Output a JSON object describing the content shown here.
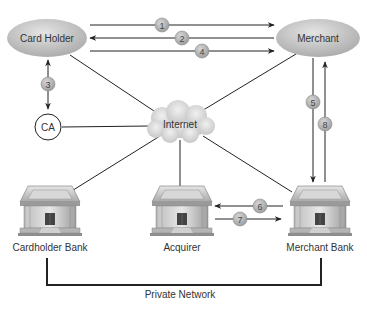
{
  "diagram": {
    "nodes": {
      "card_holder": {
        "label": "Card Holder"
      },
      "merchant": {
        "label": "Merchant"
      },
      "ca": {
        "label": "CA"
      },
      "internet": {
        "label": "Internet"
      },
      "cardholder_bank": {
        "label": "Cardholder Bank"
      },
      "acquirer": {
        "label": "Acquirer"
      },
      "merchant_bank": {
        "label": "Merchant Bank"
      }
    },
    "steps": [
      {
        "n": "1",
        "from": "Card Holder",
        "to": "Merchant"
      },
      {
        "n": "2",
        "from": "Merchant",
        "to": "Card Holder"
      },
      {
        "n": "3",
        "from": "Card Holder",
        "to": "CA",
        "bidirectional": true
      },
      {
        "n": "4",
        "from": "Card Holder",
        "to": "Merchant"
      },
      {
        "n": "5",
        "from": "Merchant",
        "to": "Merchant Bank"
      },
      {
        "n": "6",
        "from": "Merchant Bank",
        "to": "Acquirer"
      },
      {
        "n": "7",
        "from": "Acquirer",
        "to": "Merchant Bank"
      },
      {
        "n": "8",
        "from": "Merchant Bank",
        "to": "Merchant"
      }
    ],
    "private_network": {
      "label": "Private Network"
    },
    "colors": {
      "line": "#222222",
      "node_fill": "#c8c8c8",
      "badge_fill": "#b5b5b5"
    }
  }
}
